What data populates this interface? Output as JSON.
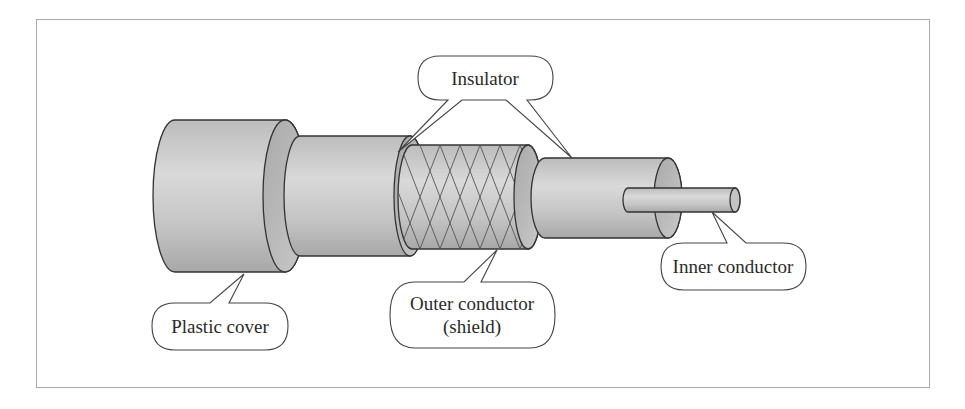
{
  "figure": {
    "type": "coaxial-cable-cutaway",
    "labels": {
      "insulator": "Insulator",
      "plastic_cover": "Plastic cover",
      "outer_conductor_line1": "Outer conductor",
      "outer_conductor_line2": "(shield)",
      "inner_conductor": "Inner conductor"
    },
    "colors": {
      "frame": "#a9a9a9",
      "outline": "#333333",
      "fill_light": "#d4d4d4",
      "fill_mid": "#bdbdbd",
      "fill_dark": "#9e9e9e",
      "callout_fill": "#ffffff"
    }
  }
}
